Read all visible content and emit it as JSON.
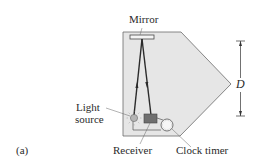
{
  "figure": {
    "panel_label": "(a)",
    "labels": {
      "mirror": "Mirror",
      "light_source_line1": "Light",
      "light_source_line2": "source",
      "receiver": "Receiver",
      "clock_timer": "Clock timer",
      "distance": "D"
    },
    "colors": {
      "device_fill": "#e6e6e6",
      "device_stroke": "#5a5a5a",
      "beam": "#2b2b2b",
      "receiver_fill": "#6f6f6f",
      "light_fill": "#b4b4b4"
    }
  }
}
